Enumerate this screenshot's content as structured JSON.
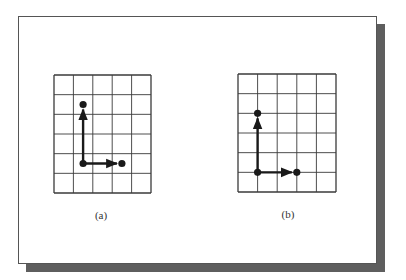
{
  "figure": {
    "panels": [
      {
        "id": "a",
        "caption": "(a)",
        "grid": {
          "cols": 5,
          "rows": 6,
          "x": 54,
          "y": 75,
          "width": 97,
          "height": 118
        },
        "placement": "cell-centers",
        "origin": [
          1.5,
          4.5
        ],
        "vectors": [
          {
            "name": "up-vector",
            "to": [
              1.5,
              1.5
            ]
          },
          {
            "name": "right-vector",
            "to": [
              3.5,
              4.5
            ]
          }
        ],
        "caption_pos": {
          "x": 101,
          "y": 209
        }
      },
      {
        "id": "b",
        "caption": "(b)",
        "grid": {
          "cols": 5,
          "rows": 6,
          "x": 238,
          "y": 74,
          "width": 98,
          "height": 118
        },
        "placement": "grid-intersections",
        "origin": [
          1,
          5
        ],
        "vectors": [
          {
            "name": "up-vector",
            "to": [
              1,
              2
            ]
          },
          {
            "name": "right-vector",
            "to": [
              3,
              5
            ]
          }
        ],
        "caption_pos": {
          "x": 288,
          "y": 208
        }
      }
    ],
    "colors": {
      "grid_line": "#3a3a3a",
      "vector": "#1a1a1a",
      "shadow": "#5e5e5e",
      "card_border": "#555555"
    }
  }
}
